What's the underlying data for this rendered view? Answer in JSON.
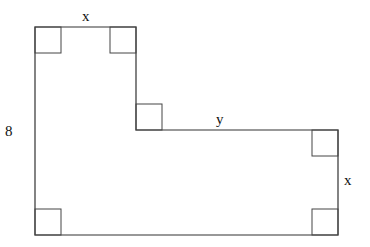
{
  "diagram": {
    "type": "geometry-figure",
    "shape": "L-shaped polygon with right-angle markers",
    "stroke_color": "#333333",
    "background": "#ffffff",
    "vertices": [
      [
        35,
        27
      ],
      [
        136,
        27
      ],
      [
        136,
        130
      ],
      [
        338,
        130
      ],
      [
        338,
        235
      ],
      [
        35,
        235
      ]
    ],
    "right_angle_markers": [
      {
        "corner": "top-left",
        "x": 35,
        "y": 27
      },
      {
        "corner": "top-inner-right",
        "x": 110,
        "y": 27
      },
      {
        "corner": "inner-step",
        "x": 136,
        "y": 104
      },
      {
        "corner": "right-top",
        "x": 312,
        "y": 130
      },
      {
        "corner": "bottom-right",
        "x": 312,
        "y": 209
      },
      {
        "corner": "bottom-left",
        "x": 35,
        "y": 209
      }
    ],
    "marker_size": 26,
    "labels": {
      "top": "x",
      "middle": "y",
      "left": "8",
      "right": "x"
    }
  }
}
